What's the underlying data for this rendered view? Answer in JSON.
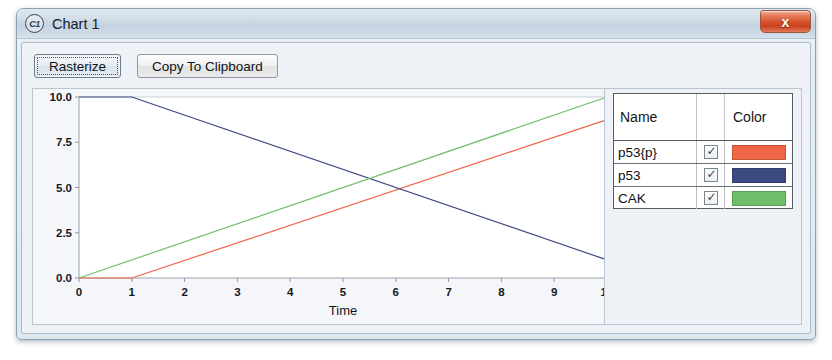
{
  "window": {
    "title": "Chart 1",
    "app_icon": "c1-circle-icon",
    "close_label": "x"
  },
  "toolbar": {
    "rasterize_label": "Rasterize",
    "copy_label": "Copy To Clipboard"
  },
  "legend": {
    "header": {
      "name": "Name",
      "color": "Color"
    },
    "rows": [
      {
        "name": "p53{p}",
        "checked": "✓",
        "color": "#ef6647"
      },
      {
        "name": "p53",
        "checked": "✓",
        "color": "#3e4a82"
      },
      {
        "name": "CAK",
        "checked": "✓",
        "color": "#6fbf6a"
      }
    ]
  },
  "chart_data": {
    "type": "line",
    "title": "",
    "xlabel": "Time",
    "ylabel": "",
    "xlim": [
      0,
      10
    ],
    "ylim": [
      0,
      10
    ],
    "xticks": [
      "0",
      "1",
      "2",
      "3",
      "4",
      "5",
      "6",
      "7",
      "8",
      "9",
      "10"
    ],
    "yticks": [
      "0.0",
      "2.5",
      "5.0",
      "7.5",
      "10.0"
    ],
    "grid": false,
    "legend_position": "right-panel",
    "series": [
      {
        "name": "p53{p}",
        "color": "#ef6647",
        "x": [
          0,
          1,
          10
        ],
        "y": [
          0,
          0,
          8.75
        ]
      },
      {
        "name": "p53",
        "color": "#3e4a82",
        "x": [
          0,
          1,
          10
        ],
        "y": [
          10,
          10,
          1.0
        ]
      },
      {
        "name": "CAK",
        "color": "#6fbf6a",
        "x": [
          0,
          10
        ],
        "y": [
          0,
          10
        ]
      }
    ]
  }
}
